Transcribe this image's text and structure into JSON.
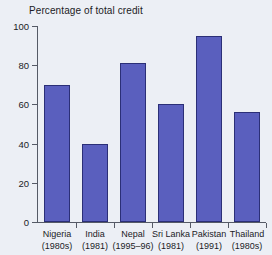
{
  "chart_data": {
    "type": "bar",
    "title": "Percentage of total credit",
    "subtitle": "",
    "xlabel": "",
    "ylabel": "",
    "ylim": [
      0,
      100
    ],
    "yticks": [
      0,
      20,
      40,
      60,
      80,
      100
    ],
    "ytick_labels": [
      "0",
      "20",
      "40",
      "60",
      "80",
      "100"
    ],
    "grid": false,
    "legend": false,
    "bar_color": "#5a5fbe",
    "bar_border_color": "#2b2f77",
    "background_color": "#eceff5",
    "categories": [
      "Nigeria (1980s)",
      "India (1981)",
      "Nepal (1995–96)",
      "Sri Lanka (1981)",
      "Pakistan (1991)",
      "Thailand (1980s)"
    ],
    "category_names": [
      "Nigeria",
      "India",
      "Nepal",
      "Sri Lanka",
      "Pakistan",
      "Thailand"
    ],
    "category_periods": [
      "(1980s)",
      "(1981)",
      "(1995–96)",
      "(1981)",
      "(1991)",
      "(1980s)"
    ],
    "values": [
      70,
      40,
      81,
      60,
      95,
      56
    ],
    "series": [
      {
        "name": "Percentage of total credit",
        "values": [
          70,
          40,
          81,
          60,
          95,
          56
        ]
      }
    ]
  }
}
